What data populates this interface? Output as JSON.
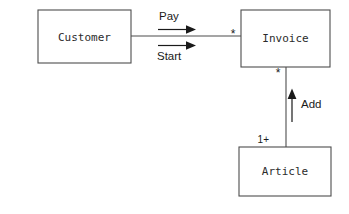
{
  "diagram": {
    "type": "uml-class-association-diagram",
    "background_color": "#ffffff",
    "stroke_color": "#4d4d4d",
    "text_color": "#1a1a1a",
    "width": 349,
    "height": 214,
    "classes": [
      {
        "id": "customer",
        "label": "Customer",
        "x": 38,
        "y": 10,
        "width": 93,
        "height": 53
      },
      {
        "id": "invoice",
        "label": "Invoice",
        "x": 241,
        "y": 10,
        "width": 89,
        "height": 57
      },
      {
        "id": "article",
        "label": "Article",
        "x": 239,
        "y": 147,
        "width": 92,
        "height": 49
      }
    ],
    "associations": [
      {
        "id": "customer-invoice",
        "from": "customer",
        "to": "invoice",
        "orientation": "horizontal",
        "multiplicity_target": "*"
      },
      {
        "id": "invoice-article",
        "from": "article",
        "to": "invoice",
        "orientation": "vertical",
        "multiplicity_target": "*",
        "multiplicity_source": "1+"
      }
    ],
    "action_arrows": [
      {
        "id": "pay",
        "label": "Pay",
        "label_position": "above",
        "direction": "right"
      },
      {
        "id": "start",
        "label": "Start",
        "label_position": "below",
        "direction": "right"
      },
      {
        "id": "add",
        "label": "Add",
        "label_position": "right",
        "direction": "up"
      }
    ]
  }
}
